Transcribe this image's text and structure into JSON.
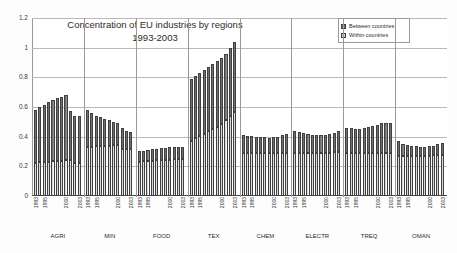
{
  "chart_data": {
    "type": "bar",
    "stacked": true,
    "title": "Concentration of EU industries by regions",
    "subtitle": "1993-2003",
    "xlabel": "",
    "ylabel": "",
    "ylim": [
      0,
      1.2
    ],
    "ytick_labels": [
      "0",
      "0.2",
      "0.4",
      "0.6",
      "0.8",
      "1",
      "1.2"
    ],
    "ytick_values": [
      0,
      0.2,
      0.4,
      0.6,
      0.8,
      1,
      1.2
    ],
    "grid": true,
    "legend_position": "top-right",
    "legend": [
      "Between countries",
      "Within countries"
    ],
    "series": [
      {
        "name": "Within countries",
        "color": "#f0f0f0"
      },
      {
        "name": "Between countries",
        "color": "#7d7d7d"
      }
    ],
    "x": [
      "1993",
      "1994",
      "1995",
      "1996",
      "1997",
      "1998",
      "1999",
      "2000",
      "2001",
      "2002",
      "2003"
    ],
    "x_tick_labels_shown": [
      "1993",
      "1995",
      "2000",
      "2003"
    ],
    "groups": [
      {
        "name": "AGRI",
        "within": [
          0.225,
          0.228,
          0.23,
          0.232,
          0.234,
          0.236,
          0.238,
          0.24,
          0.242,
          0.225,
          0.222
        ],
        "between": [
          0.355,
          0.372,
          0.385,
          0.4,
          0.416,
          0.424,
          0.432,
          0.44,
          0.33,
          0.315,
          0.318
        ],
        "total": [
          0.58,
          0.6,
          0.615,
          0.632,
          0.65,
          0.66,
          0.67,
          0.68,
          0.572,
          0.54,
          0.54
        ]
      },
      {
        "name": "MIN",
        "within": [
          0.33,
          0.332,
          0.334,
          0.336,
          0.338,
          0.34,
          0.342,
          0.344,
          0.32,
          0.318,
          0.316
        ],
        "between": [
          0.25,
          0.228,
          0.206,
          0.194,
          0.182,
          0.17,
          0.158,
          0.146,
          0.14,
          0.122,
          0.114
        ]
      },
      {
        "name": "FOOD",
        "within": [
          0.232,
          0.234,
          0.236,
          0.238,
          0.24,
          0.242,
          0.244,
          0.246,
          0.248,
          0.25,
          0.252
        ],
        "between": [
          0.07,
          0.072,
          0.074,
          0.076,
          0.078,
          0.08,
          0.082,
          0.084,
          0.082,
          0.08,
          0.078
        ]
      },
      {
        "name": "TEX",
        "within": [
          0.37,
          0.388,
          0.404,
          0.42,
          0.436,
          0.452,
          0.468,
          0.484,
          0.51,
          0.54,
          0.568
        ],
        "between": [
          0.42,
          0.422,
          0.426,
          0.43,
          0.434,
          0.438,
          0.442,
          0.446,
          0.45,
          0.46,
          0.472
        ]
      },
      {
        "name": "CHEM",
        "within": [
          0.288,
          0.288,
          0.288,
          0.289,
          0.289,
          0.29,
          0.29,
          0.291,
          0.291,
          0.292,
          0.292
        ],
        "between": [
          0.122,
          0.118,
          0.114,
          0.111,
          0.108,
          0.106,
          0.104,
          0.106,
          0.11,
          0.116,
          0.124
        ]
      },
      {
        "name": "ELECTR",
        "within": [
          0.292,
          0.292,
          0.292,
          0.292,
          0.292,
          0.292,
          0.293,
          0.293,
          0.293,
          0.294,
          0.294
        ],
        "between": [
          0.148,
          0.138,
          0.132,
          0.126,
          0.122,
          0.118,
          0.116,
          0.118,
          0.122,
          0.13,
          0.146
        ]
      },
      {
        "name": "TREQ",
        "within": [
          0.288,
          0.288,
          0.288,
          0.289,
          0.289,
          0.29,
          0.29,
          0.291,
          0.291,
          0.292,
          0.292
        ],
        "between": [
          0.172,
          0.168,
          0.164,
          0.166,
          0.17,
          0.176,
          0.182,
          0.19,
          0.198,
          0.2,
          0.198
        ]
      },
      {
        "name": "OMAN",
        "within": [
          0.272,
          0.272,
          0.272,
          0.272,
          0.272,
          0.273,
          0.273,
          0.273,
          0.274,
          0.274,
          0.274
        ],
        "between": [
          0.098,
          0.082,
          0.072,
          0.066,
          0.062,
          0.06,
          0.06,
          0.062,
          0.066,
          0.074,
          0.086
        ]
      }
    ]
  }
}
